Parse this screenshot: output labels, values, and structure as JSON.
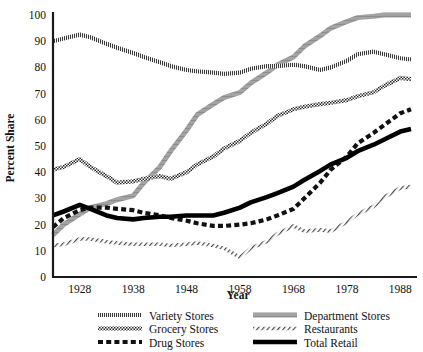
{
  "chart_data": {
    "type": "line",
    "title": "",
    "xlabel": "Year",
    "ylabel": "Percent Share",
    "xlim": [
      1923,
      1990
    ],
    "ylim": [
      0,
      100
    ],
    "xticks": [
      1928,
      1938,
      1948,
      1958,
      1968,
      1978,
      1988
    ],
    "yticks": [
      0,
      10,
      20,
      30,
      40,
      50,
      60,
      70,
      80,
      90,
      100
    ],
    "grid": false,
    "legend_position": "below",
    "x": [
      1923,
      1925,
      1928,
      1930,
      1933,
      1935,
      1938,
      1940,
      1943,
      1945,
      1948,
      1950,
      1953,
      1955,
      1958,
      1960,
      1963,
      1965,
      1968,
      1970,
      1973,
      1975,
      1978,
      1980,
      1983,
      1985,
      1988,
      1990
    ],
    "series": [
      {
        "name": "Variety Stores",
        "color": "#3a3a3a",
        "style": "fine-hatch",
        "values": [
          90,
          91,
          92.5,
          91.5,
          89,
          87.5,
          85.5,
          84,
          82,
          80.5,
          79,
          78.5,
          78,
          77.5,
          78,
          79.5,
          80.5,
          80.5,
          81,
          80.5,
          79,
          80,
          82.5,
          85,
          86,
          85,
          83.5,
          83
        ]
      },
      {
        "name": "Department Stores",
        "color": "#a0a0a0",
        "style": "thick-gray",
        "values": [
          16,
          20,
          24,
          26.5,
          28,
          29.5,
          31,
          36,
          42,
          48,
          56,
          62,
          66,
          68.5,
          70.5,
          74,
          78,
          81,
          84,
          88,
          92,
          95,
          97.5,
          99,
          99.5,
          100,
          100,
          100
        ]
      },
      {
        "name": "Grocery Stores",
        "color": "#2b2b2b",
        "style": "cross-hatch",
        "values": [
          41,
          42,
          45,
          42,
          38.5,
          36,
          36.5,
          37.5,
          38.5,
          37.5,
          40,
          43,
          46,
          49,
          52,
          55,
          58.5,
          61.5,
          64,
          65,
          66,
          66.5,
          67.5,
          69,
          70.5,
          73,
          76,
          75.5
        ]
      },
      {
        "name": "Restaurants",
        "color": "#4a4a4a",
        "style": "sparse-hatch",
        "values": [
          12,
          12.5,
          14.5,
          14.5,
          13.5,
          13,
          12.5,
          12.5,
          12.5,
          12,
          12.5,
          13,
          12,
          11,
          7.5,
          11,
          13.5,
          16.5,
          19.5,
          17.5,
          18,
          17.5,
          21,
          24,
          27,
          30.5,
          34,
          34.5
        ]
      },
      {
        "name": "Drug Stores",
        "color": "#111111",
        "style": "dash",
        "values": [
          19,
          22.5,
          25.5,
          26.5,
          26.5,
          26,
          25.5,
          24.5,
          23.5,
          22.5,
          21.5,
          20.5,
          19.5,
          19.5,
          20,
          20.5,
          22,
          23.5,
          26,
          30,
          36,
          41,
          46,
          51,
          55,
          58,
          62.5,
          64
        ]
      },
      {
        "name": "Total Retail",
        "color": "#000000",
        "style": "solid-thick",
        "values": [
          23.5,
          25,
          27.5,
          26,
          23.5,
          22.5,
          22,
          22.5,
          23,
          23,
          23.5,
          23.5,
          23.5,
          24.5,
          26.5,
          28.5,
          30.5,
          32,
          34.5,
          37,
          40.5,
          43,
          45.5,
          48,
          50.5,
          52.5,
          55.5,
          56.5
        ]
      }
    ]
  },
  "legend": {
    "entries": [
      {
        "label": "Variety Stores"
      },
      {
        "label": "Department Stores"
      },
      {
        "label": "Grocery Stores"
      },
      {
        "label": "Restaurants"
      },
      {
        "label": "Drug Stores"
      },
      {
        "label": "Total Retail"
      }
    ]
  },
  "axes": {
    "y_title": "Percent Share",
    "x_title": "Year",
    "y_tick_labels": [
      "100",
      "90",
      "80",
      "70",
      "60",
      "50",
      "40",
      "30",
      "20",
      "10",
      "0"
    ],
    "x_tick_labels": [
      "1928",
      "1938",
      "1948",
      "1958",
      "1968",
      "1978",
      "1988"
    ]
  }
}
